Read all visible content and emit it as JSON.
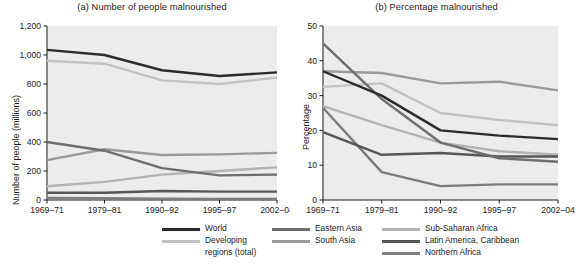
{
  "figure": {
    "panel_a_title": "(a) Number of people malnourished",
    "panel_b_title": "(b) Percentage malnourished",
    "ylabel_a": "Number of people (millions)",
    "ylabel_b": "Percentage"
  },
  "legend": {
    "columns": [
      {
        "items": [
          {
            "label": "World",
            "label2": "",
            "color": "#2b2b2b"
          },
          {
            "label": "Developing",
            "label2": "regions (total)",
            "color": "#c3c3c3"
          }
        ]
      },
      {
        "items": [
          {
            "label": "Eastern Asia",
            "label2": "",
            "color": "#6e6e6e"
          },
          {
            "label": "South Asia",
            "label2": "",
            "color": "#9a9a9a"
          }
        ]
      },
      {
        "items": [
          {
            "label": "Sub-Saharan Africa",
            "label2": "",
            "color": "#b3b3b3"
          },
          {
            "label": "Latin America, Caribbean",
            "label2": "",
            "color": "#565656"
          },
          {
            "label": "Northern Africa",
            "label2": "",
            "color": "#7c7c7c"
          }
        ]
      }
    ]
  },
  "chart_data": [
    {
      "type": "line",
      "title": "(a) Number of people malnourished",
      "xlabel": "",
      "ylabel": "Number of people (millions)",
      "categories": [
        "1969–71",
        "1979–81",
        "1990–92",
        "1995–97",
        "2002–04"
      ],
      "ylim": [
        0,
        1200
      ],
      "yticks": [
        0,
        200,
        400,
        600,
        800,
        1000,
        1200
      ],
      "ytick_labels": [
        "0",
        "200",
        "400",
        "600",
        "800",
        "1,000",
        "1,200"
      ],
      "grid": false,
      "legend_position": "bottom",
      "series": [
        {
          "name": "World",
          "color": "#2b2b2b",
          "values": [
            1035,
            1000,
            895,
            855,
            880
          ]
        },
        {
          "name": "Developing regions (total)",
          "color": "#c3c3c3",
          "values": [
            960,
            940,
            825,
            800,
            845
          ]
        },
        {
          "name": "Eastern Asia",
          "color": "#6e6e6e",
          "values": [
            400,
            340,
            220,
            170,
            175
          ]
        },
        {
          "name": "South Asia",
          "color": "#9a9a9a",
          "values": [
            275,
            350,
            310,
            315,
            325
          ]
        },
        {
          "name": "Sub-Saharan Africa",
          "color": "#b3b3b3",
          "values": [
            95,
            125,
            175,
            200,
            225
          ]
        },
        {
          "name": "Latin America, Caribbean",
          "color": "#565656",
          "values": [
            50,
            50,
            62,
            58,
            58
          ]
        },
        {
          "name": "Northern Africa",
          "color": "#7c7c7c",
          "values": [
            15,
            12,
            9,
            8,
            8
          ]
        }
      ]
    },
    {
      "type": "line",
      "title": "(b) Percentage malnourished",
      "xlabel": "",
      "ylabel": "Percentage",
      "categories": [
        "1969–71",
        "1979–81",
        "1990–92",
        "1995–97",
        "2002–04"
      ],
      "ylim": [
        0,
        50
      ],
      "yticks": [
        0,
        10,
        20,
        30,
        40,
        50
      ],
      "ytick_labels": [
        "0",
        "10",
        "20",
        "30",
        "40",
        "50"
      ],
      "grid": false,
      "legend_position": "bottom",
      "series": [
        {
          "name": "World",
          "color": "#2b2b2b",
          "values": [
            37,
            30,
            20,
            18.5,
            17.5
          ]
        },
        {
          "name": "Developing regions (total)",
          "color": "#c3c3c3",
          "values": [
            32.5,
            33.5,
            25,
            23,
            21.5
          ]
        },
        {
          "name": "Eastern Asia",
          "color": "#6e6e6e",
          "values": [
            45,
            29,
            16.5,
            12,
            11
          ]
        },
        {
          "name": "South Asia",
          "color": "#9a9a9a",
          "values": [
            37,
            36.5,
            33.5,
            34,
            31.5
          ]
        },
        {
          "name": "Sub-Saharan Africa",
          "color": "#b3b3b3",
          "values": [
            27,
            21.5,
            16.5,
            14,
            13
          ]
        },
        {
          "name": "Latin America, Caribbean",
          "color": "#565656",
          "values": [
            19.5,
            13,
            13.5,
            12.5,
            12.5
          ]
        },
        {
          "name": "Northern Africa",
          "color": "#7c7c7c",
          "values": [
            26.5,
            8,
            4,
            4.5,
            4.5
          ]
        }
      ]
    }
  ]
}
